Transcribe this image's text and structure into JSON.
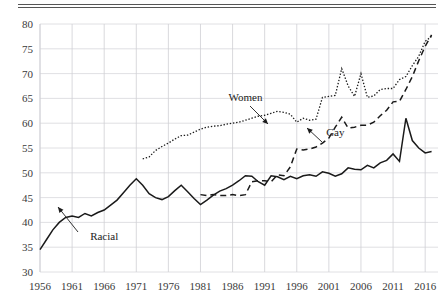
{
  "chart_data": {
    "type": "line",
    "title": "",
    "subtitle": "",
    "xlabel": "",
    "ylabel": "",
    "xlim": [
      1956,
      2018
    ],
    "ylim": [
      30,
      80
    ],
    "grid": true,
    "legend_position": "inline-annotations",
    "x_ticks": [
      "1956",
      "1961",
      "1966",
      "1971",
      "1976",
      "1981",
      "1986",
      "1991",
      "1996",
      "2001",
      "2006",
      "2011",
      "2016"
    ],
    "y_ticks": [
      "30",
      "35",
      "40",
      "45",
      "50",
      "55",
      "60",
      "65",
      "70",
      "75",
      "80"
    ],
    "annotations": [
      {
        "label": "Racial",
        "x": 1966,
        "y": 36.5,
        "points_to_series": "Racial"
      },
      {
        "label": "Women",
        "x": 1988,
        "y": 64.5,
        "points_to_series": "Women"
      },
      {
        "label": "Gay",
        "x": 2002,
        "y": 57.5,
        "points_to_series": "Gay"
      }
    ],
    "series": [
      {
        "name": "Racial",
        "style": "solid",
        "x": [
          1956,
          1957,
          1958,
          1959,
          1960,
          1961,
          1962,
          1963,
          1964,
          1965,
          1966,
          1967,
          1968,
          1969,
          1970,
          1971,
          1972,
          1973,
          1974,
          1975,
          1976,
          1977,
          1978,
          1979,
          1980,
          1981,
          1982,
          1983,
          1984,
          1985,
          1986,
          1987,
          1988,
          1989,
          1990,
          1991,
          1992,
          1993,
          1994,
          1995,
          1996,
          1997,
          1998,
          1999,
          2000,
          2001,
          2002,
          2003,
          2004,
          2005,
          2006,
          2007,
          2008,
          2009,
          2010,
          2011,
          2012,
          2013,
          2014,
          2015,
          2016,
          2017
        ],
        "values": [
          34.5,
          36.5,
          38.5,
          40,
          41,
          41.3,
          41,
          41.8,
          41.3,
          42,
          42.5,
          43.5,
          44.5,
          46,
          47.5,
          48.8,
          47.5,
          45.8,
          45,
          44.6,
          45.2,
          46.4,
          47.5,
          46.2,
          44.8,
          43.6,
          44.5,
          45.5,
          46.3,
          46.8,
          47.5,
          48.4,
          49.4,
          49.3,
          48.2,
          47.5,
          49.4,
          49.2,
          48.6,
          49.3,
          48.8,
          49.4,
          49.6,
          49.3,
          50.2,
          49.9,
          49.3,
          49.8,
          51,
          50.7,
          50.6,
          51.5,
          51,
          52,
          52.5,
          53.8,
          52.3,
          61,
          56.5,
          55,
          54,
          54.3
        ]
      },
      {
        "name": "Women",
        "style": "dotted",
        "x": [
          1972,
          1973,
          1974,
          1975,
          1976,
          1977,
          1978,
          1979,
          1980,
          1981,
          1982,
          1983,
          1984,
          1985,
          1986,
          1987,
          1988,
          1989,
          1990,
          1991,
          1992,
          1993,
          1994,
          1995,
          1996,
          1997,
          1998,
          1999,
          2000,
          2001,
          2002,
          2003,
          2004,
          2005,
          2006,
          2007,
          2008,
          2009,
          2010,
          2011,
          2012,
          2013,
          2014,
          2015,
          2016,
          2017
        ],
        "values": [
          52.8,
          53.2,
          54.5,
          55.3,
          56,
          56.8,
          57.5,
          57.6,
          58.2,
          58.8,
          59.2,
          59.4,
          59.5,
          59.8,
          60,
          60.2,
          60.6,
          61,
          61.4,
          61.6,
          62,
          62.4,
          62.2,
          61.8,
          60.2,
          61,
          60.6,
          60.8,
          65.2,
          65.4,
          65.6,
          71,
          67.5,
          65.4,
          70,
          65.2,
          65.5,
          66.8,
          67,
          67,
          68.8,
          69.4,
          71.6,
          73.5,
          76.5,
          77.5
        ]
      },
      {
        "name": "Gay",
        "style": "dashed",
        "x": [
          1981,
          1982,
          1983,
          1984,
          1985,
          1986,
          1987,
          1988,
          1989,
          1990,
          1991,
          1992,
          1993,
          1994,
          1995,
          1996,
          1997,
          1998,
          1999,
          2000,
          2001,
          2002,
          2003,
          2004,
          2005,
          2006,
          2007,
          2008,
          2009,
          2010,
          2011,
          2012,
          2013,
          2014,
          2015,
          2016,
          2017
        ],
        "values": [
          45.6,
          45.4,
          45.6,
          45.4,
          45.4,
          45.6,
          45.4,
          45.6,
          48.2,
          48.4,
          48.4,
          48.2,
          49.6,
          49.4,
          51.2,
          54.8,
          54.6,
          54.8,
          55.2,
          56,
          57,
          59.2,
          61.2,
          59,
          59.2,
          59.6,
          59.6,
          60.2,
          61.5,
          62.6,
          64.3,
          64.4,
          66.8,
          69.4,
          72.6,
          75.5,
          77.8
        ]
      }
    ]
  }
}
